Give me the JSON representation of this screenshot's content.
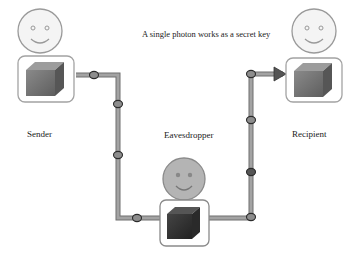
{
  "diagram": {
    "title": "A single photon works as a secret key",
    "actors": [
      {
        "id": "sender",
        "label": "Sender"
      },
      {
        "id": "eavesdropper",
        "label": "Eavesdropper"
      },
      {
        "id": "recipient",
        "label": "Recipient"
      }
    ],
    "colors": {
      "pipe": "#9e9e9e",
      "pipe_edge": "#6f6f6f",
      "node_fill": "#8d8d8d",
      "node_stroke": "#2b2b2b",
      "node_dark_fill": "#555555",
      "face_sender": "#f4f4f4",
      "face_eve": "#b4b4b4",
      "box_front_light": "#7a7a7a",
      "box_front_dark": "#333333"
    },
    "icons": [
      "smiley-face-icon",
      "cube-icon",
      "arrow-right-icon",
      "channel-node-icon"
    ]
  }
}
